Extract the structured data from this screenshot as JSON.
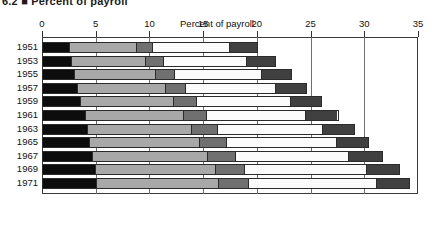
{
  "figure": {
    "title_clipped": "6.2 ■ Percent of payroll",
    "axis_title": "Percent of payroll"
  },
  "chart_data": {
    "type": "bar",
    "orientation": "horizontal",
    "stacked": true,
    "title": "Percent of payroll",
    "xlabel": "Percent of payroll",
    "ylabel": "",
    "xlim": [
      0,
      35
    ],
    "xticks": [
      0,
      5,
      10,
      15,
      20,
      25,
      30,
      35
    ],
    "xticklabels": [
      "0",
      "5",
      "10",
      "15",
      "20",
      "25",
      "30",
      "35"
    ],
    "grid": true,
    "legend": "none",
    "categories": [
      "1951",
      "1953",
      "1955",
      "1957",
      "1959",
      "1961",
      "1963",
      "1965",
      "1967",
      "1969",
      "1971"
    ],
    "series": [
      {
        "name": "Segment 1",
        "color": "#0d0d0d",
        "values": [
          2.4,
          2.6,
          2.9,
          3.2,
          3.5,
          3.9,
          4.1,
          4.3,
          4.6,
          4.9,
          5.0
        ]
      },
      {
        "name": "Segment 2",
        "color": "#a8a8a8",
        "values": [
          6.3,
          7.0,
          7.6,
          8.2,
          8.7,
          9.2,
          9.8,
          10.3,
          10.8,
          11.2,
          11.4
        ]
      },
      {
        "name": "Segment 3",
        "color": "#707070",
        "values": [
          1.5,
          1.7,
          1.8,
          1.9,
          2.1,
          2.2,
          2.4,
          2.5,
          2.6,
          2.7,
          2.8
        ]
      },
      {
        "name": "Segment 4",
        "color": "#fbfbfb",
        "values": [
          7.3,
          7.8,
          8.2,
          8.5,
          8.9,
          9.3,
          9.8,
          10.3,
          10.6,
          11.4,
          12.0
        ]
      },
      {
        "name": "Segment 5",
        "color": "#404040",
        "values": [
          2.6,
          2.7,
          2.8,
          2.9,
          2.9,
          3.0,
          3.0,
          3.0,
          3.1,
          3.1,
          3.1
        ]
      }
    ],
    "totals": [
      20.1,
      21.8,
      23.3,
      24.7,
      26.1,
      27.6,
      29.1,
      30.4,
      31.7,
      33.3,
      34.3
    ]
  }
}
